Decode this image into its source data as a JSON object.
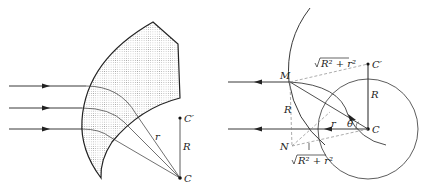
{
  "left_figure": {
    "labels": {
      "c_prime": "C′",
      "c": "C",
      "R": "R",
      "r": "r"
    },
    "ray_count": 3
  },
  "right_figure": {
    "labels": {
      "M": "M",
      "N": "N",
      "c_prime": "C′",
      "c": "C",
      "R_vertical": "R",
      "R_dashed": "R",
      "r": "r",
      "theta": "θ",
      "sqrt_top": "R² + r²",
      "sqrt_bottom": "R² + r²"
    }
  },
  "colors": {
    "stroke": "#222222",
    "fill_dots": "#9a9a9a",
    "dashed": "#888888"
  }
}
